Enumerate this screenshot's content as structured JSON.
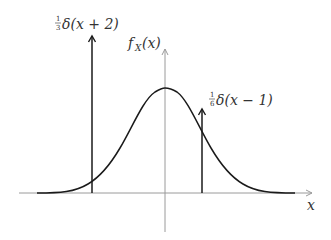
{
  "diagram": {
    "type": "pdf-with-point-masses",
    "colors": {
      "axis": "#9a9a9a",
      "curve": "#1a1a1a",
      "impulse": "#1a1a1a",
      "text": "#333333",
      "background": "#ffffff"
    },
    "axes": {
      "x_label": "x",
      "y_label": "f",
      "y_label_sub": "X",
      "y_label_arg": "(x)"
    },
    "curve": {
      "name": "gaussian density",
      "center_x": 0
    },
    "impulses": [
      {
        "position": -2,
        "weight_num": "1",
        "weight_den": "3",
        "label_text": "δ(x + 2)",
        "label_full": "1/3 δ(x + 2)"
      },
      {
        "position": 1,
        "weight_num": "1",
        "weight_den": "6",
        "label_text": "δ(x − 1)",
        "label_full": "1/6 δ(x − 1)"
      }
    ]
  }
}
